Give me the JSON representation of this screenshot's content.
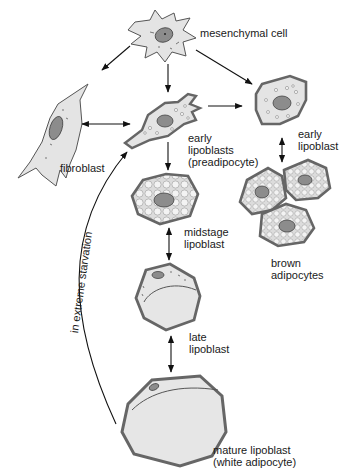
{
  "diagram": {
    "type": "cell-differentiation",
    "colors": {
      "cell_fill": "#e2e2e2",
      "cell_outline": "#555555",
      "membrane": "#8a8a8a",
      "nucleus": "#8c8c8c",
      "vacuole": "#f4f4f4",
      "lipid": "#ececec",
      "arrow": "#111111",
      "text": "#1a1a1a"
    },
    "labels": {
      "mesenchymal": "mesenchymal cell",
      "fibroblast": "fibroblast",
      "early_lipoblasts": "early\nlipoblasts\n(preadipocyte)",
      "early_lipoblast": "early\nlipoblast",
      "midstage": "midstage\nlipoblast",
      "brown": "brown\nadipocytes",
      "late": "late\nlipoblast",
      "mature": "mature lipoblast\n(white adipocyte)",
      "starvation": "in extreme starvation"
    },
    "nodes": [
      {
        "id": "mesenchymal",
        "label": "mesenchymal cell"
      },
      {
        "id": "fibroblast",
        "label": "fibroblast"
      },
      {
        "id": "early_lipoblasts",
        "label": "early lipoblasts (preadipocyte)"
      },
      {
        "id": "early_lipoblast",
        "label": "early lipoblast"
      },
      {
        "id": "brown",
        "label": "brown adipocytes"
      },
      {
        "id": "midstage",
        "label": "midstage lipoblast"
      },
      {
        "id": "late",
        "label": "late lipoblast"
      },
      {
        "id": "mature",
        "label": "mature lipoblast (white adipocyte)"
      }
    ],
    "edges": [
      {
        "from": "mesenchymal",
        "to": "fibroblast",
        "type": "one-way"
      },
      {
        "from": "mesenchymal",
        "to": "early_lipoblasts",
        "type": "one-way"
      },
      {
        "from": "mesenchymal",
        "to": "early_lipoblast",
        "type": "one-way"
      },
      {
        "from": "fibroblast",
        "to": "early_lipoblasts",
        "type": "two-way"
      },
      {
        "from": "early_lipoblasts",
        "to": "early_lipoblast",
        "type": "one-way"
      },
      {
        "from": "early_lipoblast",
        "to": "brown",
        "type": "two-way"
      },
      {
        "from": "early_lipoblasts",
        "to": "midstage",
        "type": "one-way"
      },
      {
        "from": "midstage",
        "to": "late",
        "type": "two-way"
      },
      {
        "from": "late",
        "to": "mature",
        "type": "two-way"
      },
      {
        "from": "mature",
        "to": "early_lipoblasts",
        "type": "one-way",
        "label": "in extreme starvation"
      }
    ]
  }
}
